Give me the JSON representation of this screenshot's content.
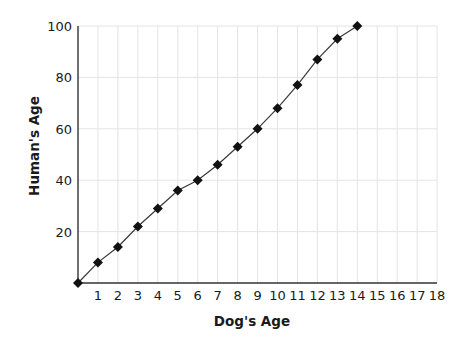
{
  "chart_data": {
    "type": "line",
    "title": "",
    "xlabel": "Dog's Age",
    "ylabel": "Human's Age",
    "x": [
      0,
      1,
      2,
      3,
      4,
      5,
      6,
      7,
      8,
      9,
      10,
      11,
      12,
      13,
      14
    ],
    "series": [
      {
        "name": "Human's Age",
        "values": [
          0,
          8,
          14,
          22,
          29,
          36,
          40,
          46,
          53,
          60,
          68,
          77,
          87,
          95,
          100
        ],
        "marker": "diamond",
        "color": "#111111"
      }
    ],
    "xlim": [
      0,
      18
    ],
    "ylim": [
      0,
      100
    ],
    "xticks": [
      1,
      2,
      3,
      4,
      5,
      6,
      7,
      8,
      9,
      10,
      11,
      12,
      13,
      14,
      15,
      16,
      17,
      18
    ],
    "yticks": [
      20,
      40,
      60,
      80,
      100
    ],
    "grid": true,
    "legend": null
  },
  "colors": {
    "axis": "#333333",
    "grid": "#e4e4e4",
    "line": "#3a3a3a",
    "marker": "#111111"
  }
}
